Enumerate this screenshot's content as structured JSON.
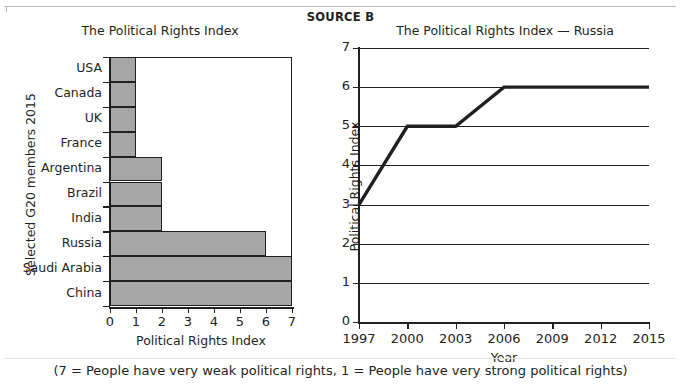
{
  "header": {
    "source_label": "SOURCE B"
  },
  "caption": "(7 = People have very weak political rights,  1 = People have very strong political rights)",
  "bar_chart": {
    "title": "The Political Rights Index",
    "xlabel": "Political Rights Index",
    "ylabel": "Selected G20 members 2015",
    "xticks": [
      "0",
      "1",
      "2",
      "3",
      "4",
      "5",
      "6",
      "7"
    ],
    "bar_color": "#a6a6a6",
    "line_color": "#231f20"
  },
  "line_chart": {
    "title": "The Political Rights Index — Russia",
    "xlabel": "Year",
    "ylabel": "Political Rights Index",
    "yticks": [
      "7",
      "6",
      "5",
      "4",
      "3",
      "2",
      "1",
      "0"
    ],
    "xticks": [
      "1997",
      "2000",
      "2003",
      "2006",
      "2009",
      "2012",
      "2015"
    ],
    "line_color": "#231f20",
    "grid_color": "#231f20"
  },
  "chart_data": [
    {
      "type": "bar",
      "orientation": "horizontal",
      "title": "The Political Rights Index",
      "xlabel": "Political Rights Index",
      "ylabel": "Selected G20 members 2015",
      "categories": [
        "USA",
        "Canada",
        "UK",
        "France",
        "Argentina",
        "Brazil",
        "India",
        "Russia",
        "Saudi Arabia",
        "China"
      ],
      "values": [
        1,
        1,
        1,
        1,
        2,
        2,
        2,
        6,
        7,
        7
      ],
      "xlim": [
        0,
        7
      ],
      "xtick_values": [
        0,
        1,
        2,
        3,
        4,
        5,
        6,
        7
      ],
      "grid": false,
      "legend": "none"
    },
    {
      "type": "line",
      "title": "The Political Rights Index — Russia",
      "xlabel": "Year",
      "ylabel": "Political Rights Index",
      "x": [
        1997,
        2000,
        2003,
        2006,
        2015
      ],
      "values": [
        3,
        5,
        5,
        6,
        6
      ],
      "xlim": [
        1997,
        2015
      ],
      "ylim": [
        0,
        7
      ],
      "xtick_values": [
        1997,
        2000,
        2003,
        2006,
        2009,
        2012,
        2015
      ],
      "ytick_values": [
        0,
        1,
        2,
        3,
        4,
        5,
        6,
        7
      ],
      "grid": true,
      "grid_axis": "y",
      "legend": "none"
    }
  ]
}
